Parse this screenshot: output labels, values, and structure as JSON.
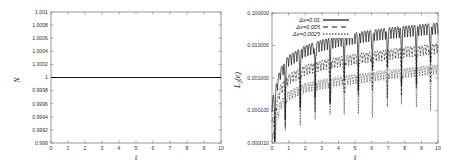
{
  "chart_data": [
    {
      "type": "line",
      "title": "",
      "xlabel": "t",
      "ylabel": "N",
      "xlim": [
        0,
        10
      ],
      "ylim": [
        0.999,
        1.001
      ],
      "xticks": [
        "0",
        "1",
        "2",
        "3",
        "4",
        "5",
        "6",
        "7",
        "8",
        "9",
        "10"
      ],
      "yticks": [
        "0.999",
        "0.9992",
        "0.9994",
        "0.9996",
        "0.9998",
        "1",
        "1.0002",
        "1.0004",
        "1.0006",
        "1.0008",
        "1.001"
      ],
      "grid": false,
      "legend": null,
      "series": [
        {
          "name": "N",
          "x": [
            0,
            10
          ],
          "values": [
            1,
            1
          ],
          "style": "solid"
        }
      ]
    },
    {
      "type": "line",
      "title": "",
      "xlabel": "t",
      "ylabel": "L2(e)",
      "yscale": "log",
      "xlim": [
        0,
        10
      ],
      "ylim": [
        1e-05,
        0.1
      ],
      "xticks": [
        "0",
        "1",
        "2",
        "3",
        "4",
        "5",
        "6",
        "7",
        "8",
        "9",
        "10"
      ],
      "yticks": [
        "0.000010",
        "0.000100",
        "0.001000",
        "0.010000",
        "0.100000"
      ],
      "grid": false,
      "legend_position": "upper left (inside)",
      "series": [
        {
          "name": "Δx=0.01",
          "style": "solid",
          "x": [
            0,
            0.5,
            1,
            2,
            3,
            4,
            5,
            6,
            7,
            8,
            9,
            10
          ],
          "values": [
            0.0002,
            0.002,
            0.005,
            0.01,
            0.015,
            0.02,
            0.025,
            0.03,
            0.035,
            0.04,
            0.045,
            0.05
          ]
        },
        {
          "name": "Δx=0.005",
          "style": "dashed",
          "x": [
            0,
            0.5,
            1,
            2,
            3,
            4,
            5,
            6,
            7,
            8,
            9,
            10
          ],
          "values": [
            5e-05,
            0.0006,
            0.0013,
            0.0025,
            0.0035,
            0.0045,
            0.0055,
            0.0065,
            0.0075,
            0.009,
            0.01,
            0.012
          ]
        },
        {
          "name": "Δx=0.0025",
          "style": "dotted",
          "x": [
            0,
            0.5,
            1,
            2,
            3,
            4,
            5,
            6,
            7,
            8,
            9,
            10
          ],
          "values": [
            2e-05,
            0.0002,
            0.0004,
            0.0007,
            0.0009,
            0.0011,
            0.0013,
            0.0015,
            0.0018,
            0.002,
            0.0023,
            0.0026
          ]
        }
      ]
    }
  ],
  "left": {
    "ylabel": "N",
    "xlabel": "t",
    "yticks": [
      "1.001",
      "1.0008",
      "1.0006",
      "1.0004",
      "1.0002",
      "1",
      "0.9998",
      "0.9996",
      "0.9994",
      "0.9992",
      "0.999"
    ],
    "xticks": [
      "0",
      "1",
      "2",
      "3",
      "4",
      "5",
      "6",
      "7",
      "8",
      "9",
      "10"
    ]
  },
  "right": {
    "ylabel": "L",
    "ylabel_sub": "2",
    "ylabel_arg": "(e)",
    "xlabel": "t",
    "yticks": [
      "0.100000",
      "0.010000",
      "0.001000",
      "0.000100",
      "0.000010"
    ],
    "xticks": [
      "0",
      "1",
      "2",
      "3",
      "4",
      "5",
      "6",
      "7",
      "8",
      "9",
      "10"
    ],
    "legend": [
      "Δx=0.01",
      "Δx=0.005",
      "Δx=0.0025"
    ]
  }
}
